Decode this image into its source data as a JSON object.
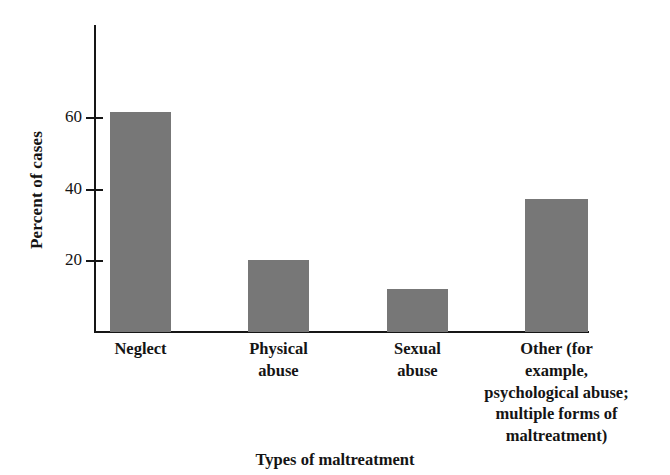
{
  "chart_data": {
    "type": "bar",
    "title": "",
    "xlabel": "Types of maltreatment",
    "ylabel": "Percent of cases",
    "categories": [
      "Neglect",
      "Physical abuse",
      "Sexual abuse",
      "Other (for example, psychological abuse; multiple forms of maltreatment)"
    ],
    "category_lines": [
      [
        "Neglect"
      ],
      [
        "Physical",
        "abuse"
      ],
      [
        "Sexual",
        "abuse"
      ],
      [
        "Other (for",
        "example,",
        "psychological abuse;",
        "multiple forms of",
        "maltreatment)"
      ]
    ],
    "values": [
      61.5,
      20,
      12,
      37
    ],
    "ylim": [
      0,
      75
    ],
    "yticks": [
      20,
      40,
      60
    ],
    "ytick_labels": [
      "20",
      "40",
      "60"
    ],
    "grid": false,
    "legend": null,
    "bar_color": "#777777",
    "axis_color": "#161616",
    "background": "#ffffff"
  }
}
